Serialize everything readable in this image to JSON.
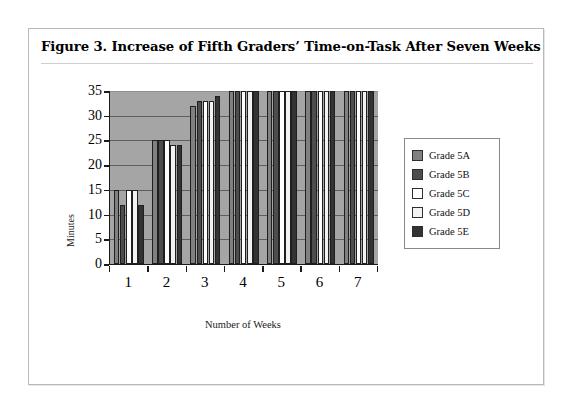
{
  "figure": {
    "title": "Figure 3.  Increase of Fifth Graders’ Time-on-Task After Seven Weeks"
  },
  "chart_data": {
    "type": "bar",
    "title": "Figure 3.  Increase of Fifth Graders’ Time-on-Task After Seven Weeks",
    "xlabel": "Number of Weeks",
    "ylabel": "Minutes",
    "categories": [
      "1",
      "2",
      "3",
      "4",
      "5",
      "6",
      "7"
    ],
    "ylim": [
      0,
      35
    ],
    "yticks": [
      0,
      5,
      10,
      15,
      20,
      25,
      30,
      35
    ],
    "grid": true,
    "legend_position": "right",
    "plot_background": "#a5a5a5",
    "series": [
      {
        "name": "Grade 5A",
        "color": "#808080",
        "values": [
          15,
          25,
          32,
          35,
          35,
          35,
          35
        ]
      },
      {
        "name": "Grade 5B",
        "color": "#4d4d4d",
        "values": [
          12,
          25,
          33,
          35,
          35,
          35,
          35
        ]
      },
      {
        "name": "Grade 5C",
        "color": "#ffffff",
        "values": [
          15,
          25,
          33,
          35,
          35,
          35,
          35
        ]
      },
      {
        "name": "Grade 5D",
        "color": "#f2f2f2",
        "values": [
          15,
          24,
          33,
          35,
          35,
          35,
          35
        ]
      },
      {
        "name": "Grade 5E",
        "color": "#333333",
        "values": [
          12,
          24,
          34,
          35,
          35,
          35,
          35
        ]
      }
    ]
  }
}
